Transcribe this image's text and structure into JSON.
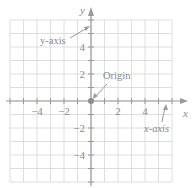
{
  "diagram": {
    "type": "coordinate-plane",
    "origin_px": [
      91,
      101
    ],
    "unit_px": 13.5,
    "grid_range": {
      "x": [
        -6,
        6
      ],
      "y": [
        -6,
        6
      ]
    },
    "colors": {
      "grid": "#d4d4d4",
      "axis": "#9a9a9a",
      "text": "#8a8a8a",
      "origin_dot": "#8c8c8c"
    },
    "axes": {
      "x_label": "x",
      "y_label": "y"
    },
    "x_ticks": [
      {
        "value": -4,
        "label": "−4"
      },
      {
        "value": -2,
        "label": "−2"
      },
      {
        "value": 2,
        "label": "2"
      },
      {
        "value": 4,
        "label": "4"
      }
    ],
    "y_ticks": [
      {
        "value": 4,
        "label": "4"
      },
      {
        "value": 2,
        "label": "2"
      },
      {
        "value": -2,
        "label": "−2"
      },
      {
        "value": -4,
        "label": "−4"
      }
    ],
    "annotations": {
      "y_axis": "y-axis",
      "origin": "Origin",
      "x_axis": "x-axis"
    }
  }
}
